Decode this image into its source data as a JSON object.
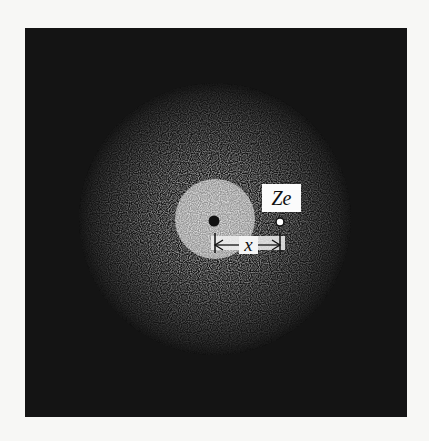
{
  "diagram": {
    "background_color": "#141414",
    "cloud_color": "#ffffff",
    "nucleus": {
      "label": "",
      "style": "filled",
      "color": "#111111"
    },
    "charge": {
      "label": "Ze",
      "style": "open"
    },
    "displacement": {
      "label": "x"
    }
  }
}
